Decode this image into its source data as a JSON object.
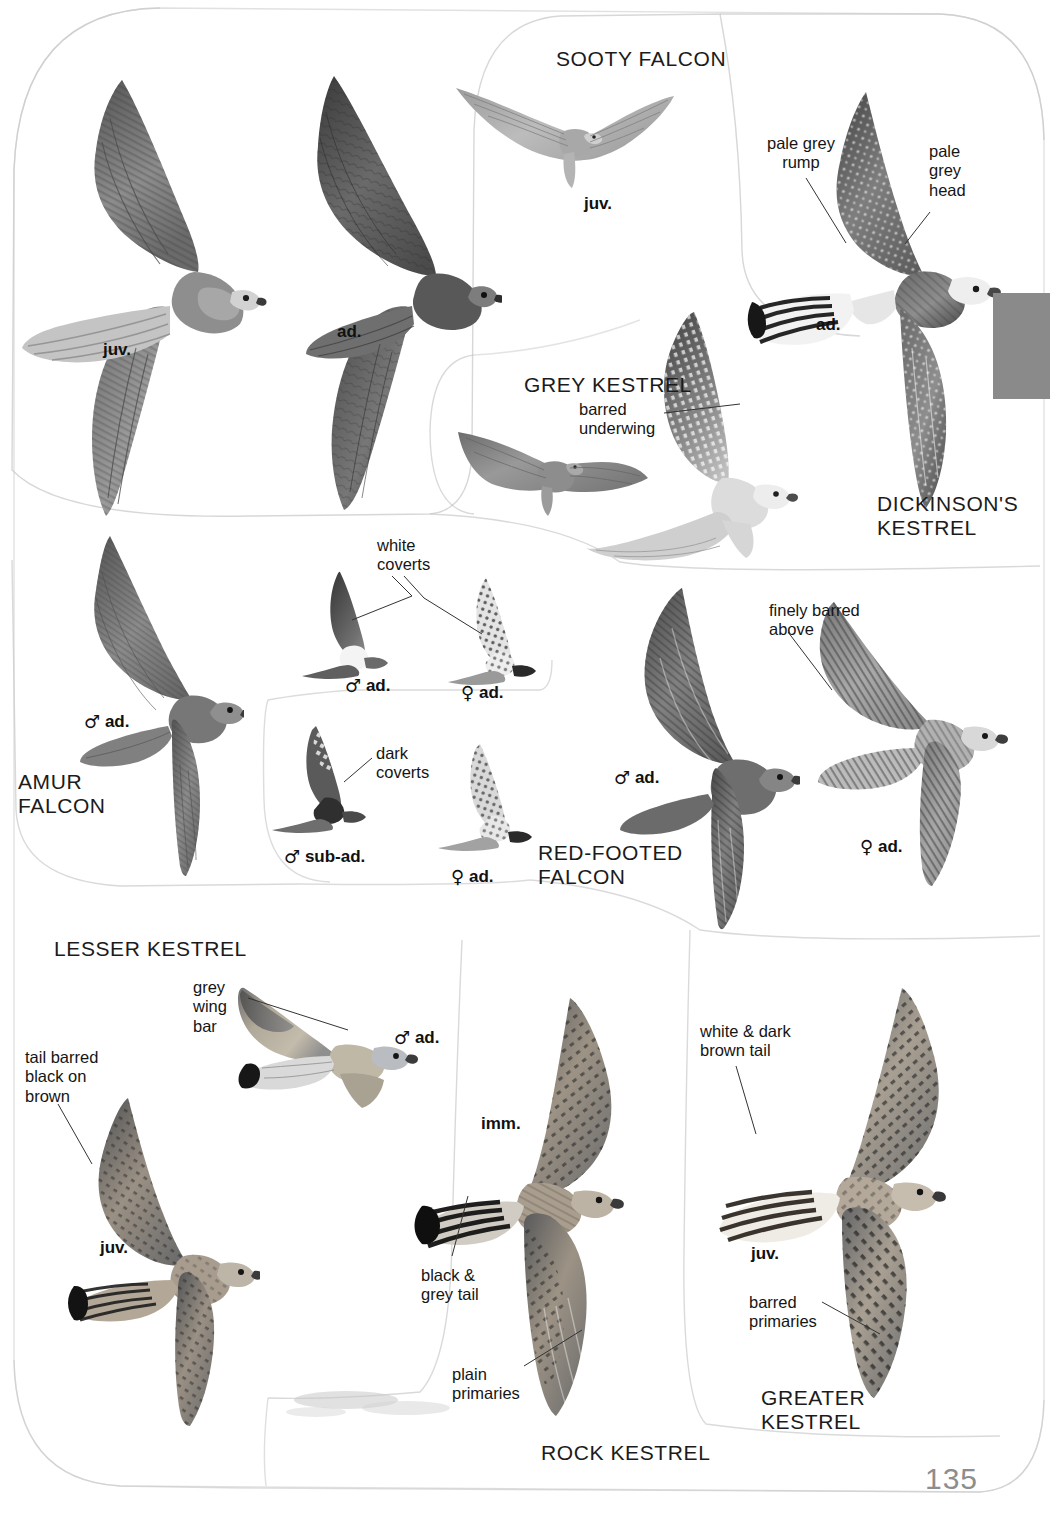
{
  "page": {
    "number": "135",
    "book_section": "Falcons and Kestrels in flight plate",
    "background_color": "#ffffff",
    "tab_color": "#8a8a8a"
  },
  "species": [
    {
      "key": "sooty_falcon",
      "name": "SOOTY FALCON",
      "x": 556,
      "y": 47,
      "align": "left"
    },
    {
      "key": "grey_kestrel",
      "name": "GREY KESTREL",
      "x": 524,
      "y": 373,
      "align": "left"
    },
    {
      "key": "dickinsons_kestrel",
      "name": "DICKINSON'S\nKESTREL",
      "x": 877,
      "y": 492,
      "align": "left"
    },
    {
      "key": "amur_falcon",
      "name": "AMUR\nFALCON",
      "x": 18,
      "y": 770,
      "align": "left"
    },
    {
      "key": "red_footed_falcon",
      "name": "RED-FOOTED\nFALCON",
      "x": 538,
      "y": 841,
      "align": "left"
    },
    {
      "key": "lesser_kestrel",
      "name": "LESSER KESTREL",
      "x": 54,
      "y": 937,
      "align": "left"
    },
    {
      "key": "rock_kestrel",
      "name": "ROCK KESTREL",
      "x": 541,
      "y": 1441,
      "align": "left"
    },
    {
      "key": "greater_kestrel",
      "name": "GREATER\nKESTREL",
      "x": 761,
      "y": 1386,
      "align": "left"
    }
  ],
  "age_labels": [
    {
      "key": "sooty_juv_large",
      "symbol": "",
      "text": "juv.",
      "x": 103,
      "y": 338
    },
    {
      "key": "sooty_ad_large",
      "symbol": "",
      "text": "ad.",
      "x": 337,
      "y": 320
    },
    {
      "key": "sooty_juv_small",
      "symbol": "",
      "text": "juv.",
      "x": 584,
      "y": 192
    },
    {
      "key": "dickinsons_ad",
      "symbol": "",
      "text": "ad.",
      "x": 816,
      "y": 313
    },
    {
      "key": "amur_male_ad",
      "symbol": "♂",
      "text": "ad.",
      "x": 84,
      "y": 710
    },
    {
      "key": "amur_m_ad_under",
      "symbol": "♂",
      "text": "ad.",
      "x": 345,
      "y": 674
    },
    {
      "key": "amur_f_ad_under",
      "symbol": "♀",
      "text": "ad.",
      "x": 461,
      "y": 681
    },
    {
      "key": "amur_m_subad_under",
      "symbol": "♂",
      "text": "sub-ad.",
      "x": 284,
      "y": 845
    },
    {
      "key": "amur_f_ad_under2",
      "symbol": "♀",
      "text": "ad.",
      "x": 451,
      "y": 865
    },
    {
      "key": "red_footed_male_ad",
      "symbol": "♂",
      "text": "ad.",
      "x": 614,
      "y": 766
    },
    {
      "key": "red_footed_female_ad",
      "symbol": "♀",
      "text": "ad.",
      "x": 860,
      "y": 835
    },
    {
      "key": "lesser_male_ad",
      "symbol": "♂",
      "text": "ad.",
      "x": 394,
      "y": 1026
    },
    {
      "key": "lesser_juv",
      "symbol": "",
      "text": "juv.",
      "x": 100,
      "y": 1236
    },
    {
      "key": "rock_imm",
      "symbol": "",
      "text": "imm.",
      "x": 481,
      "y": 1112
    },
    {
      "key": "greater_juv",
      "symbol": "",
      "text": "juv.",
      "x": 751,
      "y": 1242
    }
  ],
  "annotations": [
    {
      "key": "pale_grey_rump",
      "text": "pale grey\nrump",
      "x": 767,
      "y": 134,
      "leader": [
        [
          810,
          180
        ],
        [
          840,
          238
        ]
      ]
    },
    {
      "key": "pale_grey_head",
      "text": "pale\ngrey\nhead",
      "x": 929,
      "y": 142,
      "leader": [
        [
          927,
          206
        ],
        [
          905,
          243
        ]
      ]
    },
    {
      "key": "barred_underwing",
      "text": "barred\nunderwing",
      "x": 579,
      "y": 400,
      "leader": [
        [
          663,
          415
        ],
        [
          721,
          409
        ]
      ]
    },
    {
      "key": "white_coverts",
      "text": "white\ncoverts",
      "x": 377,
      "y": 536,
      "leader": [
        [
          390,
          578
        ],
        [
          358,
          618
        ]
      ],
      "leader2": [
        [
          408,
          578
        ],
        [
          478,
          631
        ]
      ]
    },
    {
      "key": "dark_coverts",
      "text": "dark\ncoverts",
      "x": 376,
      "y": 744,
      "leader": [
        [
          372,
          760
        ],
        [
          352,
          780
        ]
      ]
    },
    {
      "key": "finely_barred_above",
      "text": "finely barred\nabove",
      "x": 769,
      "y": 601,
      "leader": [
        [
          790,
          633
        ],
        [
          828,
          688
        ]
      ]
    },
    {
      "key": "grey_wing_bar",
      "text": "grey\nwing\nbar",
      "x": 193,
      "y": 978,
      "leader": [
        [
          250,
          1000
        ],
        [
          344,
          1028
        ]
      ]
    },
    {
      "key": "tail_barred",
      "text": "tail barred\nblack on\nbrown",
      "x": 25,
      "y": 1048,
      "leader": [
        [
          60,
          1105
        ],
        [
          88,
          1160
        ]
      ]
    },
    {
      "key": "black_grey_tail",
      "text": "black &\ngrey tail",
      "x": 421,
      "y": 1266,
      "leader": [
        [
          448,
          1258
        ],
        [
          466,
          1200
        ]
      ]
    },
    {
      "key": "plain_primaries",
      "text": "plain\nprimaries",
      "x": 452,
      "y": 1365,
      "leader": [
        [
          525,
          1368
        ],
        [
          580,
          1330
        ]
      ]
    },
    {
      "key": "white_dark_brown_tail",
      "text": "white & dark\nbrown tail",
      "x": 700,
      "y": 1022,
      "leader": [
        [
          735,
          1068
        ],
        [
          752,
          1132
        ]
      ]
    },
    {
      "key": "barred_primaries",
      "text": "barred\nprimaries",
      "x": 749,
      "y": 1293,
      "leader": [
        [
          820,
          1303
        ],
        [
          872,
          1330
        ]
      ]
    }
  ],
  "plate_panels": [
    {
      "key": "panel-sooty",
      "label": "Sooty Falcon panel"
    },
    {
      "key": "panel-dickinson",
      "label": "Dickinson's Kestrel panel"
    },
    {
      "key": "panel-grey",
      "label": "Grey Kestrel panel"
    },
    {
      "key": "panel-amur",
      "label": "Amur Falcon panel"
    },
    {
      "key": "panel-redfoot",
      "label": "Red-footed Falcon panel"
    },
    {
      "key": "panel-lesser",
      "label": "Lesser Kestrel panel"
    },
    {
      "key": "panel-rock",
      "label": "Rock Kestrel panel"
    },
    {
      "key": "panel-greater",
      "label": "Greater Kestrel panel"
    }
  ],
  "birds": [
    {
      "key": "sooty-juv-upper",
      "species": "Sooty Falcon",
      "age": "juv."
    },
    {
      "key": "sooty-ad-upper",
      "species": "Sooty Falcon",
      "age": "ad."
    },
    {
      "key": "sooty-juv-small",
      "species": "Sooty Falcon",
      "age": "juv."
    },
    {
      "key": "dickinsons-ad-upper",
      "species": "Dickinson's Kestrel",
      "age": "ad."
    },
    {
      "key": "grey-kestrel-upper",
      "species": "Grey Kestrel",
      "age": "ad."
    },
    {
      "key": "grey-kestrel-under",
      "species": "Grey Kestrel",
      "age": "ad."
    },
    {
      "key": "amur-male-upper",
      "species": "Amur Falcon",
      "age": "♂ ad."
    },
    {
      "key": "amur-male-under",
      "species": "Amur Falcon",
      "age": "♂ ad."
    },
    {
      "key": "amur-female-under",
      "species": "Amur Falcon",
      "age": "♀ ad."
    },
    {
      "key": "amur-male-subad-under",
      "species": "Amur Falcon",
      "age": "♂ sub-ad."
    },
    {
      "key": "amur-female-under-2",
      "species": "Amur Falcon",
      "age": "♀ ad."
    },
    {
      "key": "redfooted-male-upper",
      "species": "Red-footed Falcon",
      "age": "♂ ad."
    },
    {
      "key": "redfooted-female-upper",
      "species": "Red-footed Falcon",
      "age": "♀ ad."
    },
    {
      "key": "lesser-male-upper",
      "species": "Lesser Kestrel",
      "age": "♂ ad."
    },
    {
      "key": "lesser-juv-upper",
      "species": "Lesser Kestrel",
      "age": "juv."
    },
    {
      "key": "rock-imm-upper",
      "species": "Rock Kestrel",
      "age": "imm."
    },
    {
      "key": "greater-juv-upper",
      "species": "Greater Kestrel",
      "age": "juv."
    }
  ]
}
